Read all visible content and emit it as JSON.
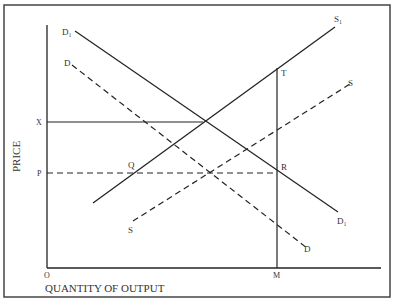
{
  "diagram": {
    "type": "supply-demand",
    "axis_labels": {
      "y": "PRICE",
      "x": "QUANTITY OF OUTPUT",
      "origin": "O"
    },
    "price_labels": {
      "x_price": "X",
      "p_price": "P"
    },
    "quantity_labels": {
      "m": "M"
    },
    "points": {
      "t": "T",
      "r": "R",
      "q": "Q"
    },
    "curves": {
      "d1": {
        "label_start": "D₁",
        "label_end": "D₁",
        "style": "solid"
      },
      "d": {
        "label_start": "D",
        "label_end": "D",
        "style": "dashed"
      },
      "s1": {
        "label": "S₁",
        "style": "solid"
      },
      "s": {
        "label_start": "S",
        "label_end": "S",
        "style": "dashed"
      }
    },
    "colors": {
      "line": "#222222",
      "text": "#333333",
      "frame": "#333333"
    }
  }
}
